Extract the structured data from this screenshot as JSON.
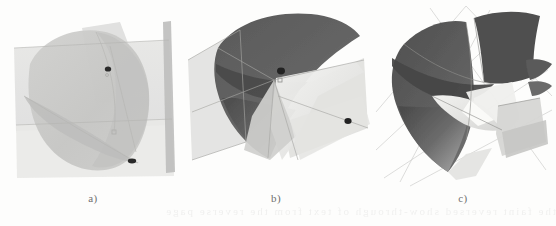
{
  "figure": {
    "kind": "scanned-scientific-figure",
    "background_color": "#fdfdfc",
    "width": 556,
    "height": 226,
    "bleed_artifact_text": "the faint reversed show-through of text from the reverse page"
  },
  "panels": [
    {
      "id": "a",
      "label": "a)",
      "caption_color": "#6f6f6f",
      "description": "Light, low-contrast shaded rendering: a large pale grey conical fan surface crossed by two translucent planes and a vertical ribbon strip at the right.",
      "render_style": "flat-light",
      "colors": {
        "surface_fill": "#c9c9c7",
        "surface_fill_alt": "#d2d2d0",
        "plane_fill": "#e3e3e1",
        "plane_fill_alt": "#dcdcda",
        "ribbon_fill": "#bdbdbb",
        "edge_stroke": "#b2b2b0",
        "marker_fill": "#2c2c2c"
      },
      "markers": [
        {
          "name": "intersection-point-upper",
          "x": 108,
          "y": 69
        },
        {
          "name": "intersection-point-lower",
          "x": 132,
          "y": 161
        }
      ]
    },
    {
      "id": "b",
      "label": "b)",
      "caption_color": "#6f6f6f",
      "description": "Higher-contrast rendering: a dark grey curved conical shell sliced by bright white and pale grey planar wedges, with wireframe intersection curves.",
      "render_style": "dark-shaded",
      "colors": {
        "shell_dark": "#565656",
        "shell_mid": "#6e6e6e",
        "shell_light": "#8d8d8d",
        "wedge_white": "#f3f3f1",
        "wedge_grey": "#c4c4c2",
        "plane_translucent": "#d8d8d6",
        "edge_stroke": "#9a9a98",
        "marker_fill": "#232323"
      },
      "markers": [
        {
          "name": "intersection-point-upper",
          "x": 281,
          "y": 71
        },
        {
          "name": "intersection-point-right",
          "x": 348,
          "y": 121
        }
      ]
    },
    {
      "id": "c",
      "label": "c)",
      "caption_color": "#6f6f6f",
      "description": "Final composed rendering: a dark shield-shaped conical shell with a bright white ribbon wedge sweeping through it, thin wireframe construction lines in the background.",
      "render_style": "dark-shaded-composed",
      "colors": {
        "shell_dark": "#4f4f4f",
        "shell_mid": "#656565",
        "shell_light": "#8a8a8a",
        "ribbon_white": "#efefed",
        "ribbon_grey": "#cfcfcd",
        "wire_stroke": "#c0c0be",
        "edge_stroke": "#8f8f8d"
      },
      "markers": []
    }
  ]
}
